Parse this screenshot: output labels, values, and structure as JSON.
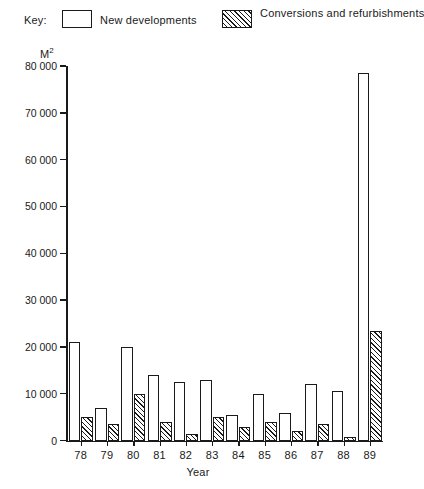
{
  "legend": {
    "key_label": "Key:",
    "items": [
      {
        "label": "New developments",
        "swatch": "white-rectangle-icon"
      },
      {
        "label": "Conversions and\nrefurbishments",
        "swatch": "hatched-rectangle-icon"
      }
    ]
  },
  "axes": {
    "y_unit": "M",
    "y_unit_sup": "2",
    "x_title": "Year",
    "y_ticks": [
      "0",
      "10 000",
      "20 000",
      "30 000",
      "40 000",
      "50 000",
      "60 000",
      "70 000",
      "80 000"
    ]
  },
  "chart_data": {
    "type": "bar",
    "title": "",
    "xlabel": "Year",
    "ylabel": "M2",
    "ylim": [
      0,
      80000
    ],
    "ytick_step": 10000,
    "grid": false,
    "legend_position": "top",
    "categories": [
      "78",
      "79",
      "80",
      "81",
      "82",
      "83",
      "84",
      "85",
      "86",
      "87",
      "88",
      "89"
    ],
    "series": [
      {
        "name": "New developments",
        "fill": "white",
        "values": [
          21000,
          7000,
          20000,
          14000,
          12500,
          13000,
          5500,
          10000,
          6000,
          12000,
          10500,
          78500
        ]
      },
      {
        "name": "Conversions and refurbishments",
        "fill": "diagonal-hatch",
        "values": [
          5000,
          3500,
          10000,
          4000,
          1500,
          5000,
          3000,
          4000,
          2000,
          3500,
          800,
          23500
        ]
      }
    ]
  },
  "colors": {
    "ink": "#1a1a1a",
    "paper": "#ffffff"
  }
}
